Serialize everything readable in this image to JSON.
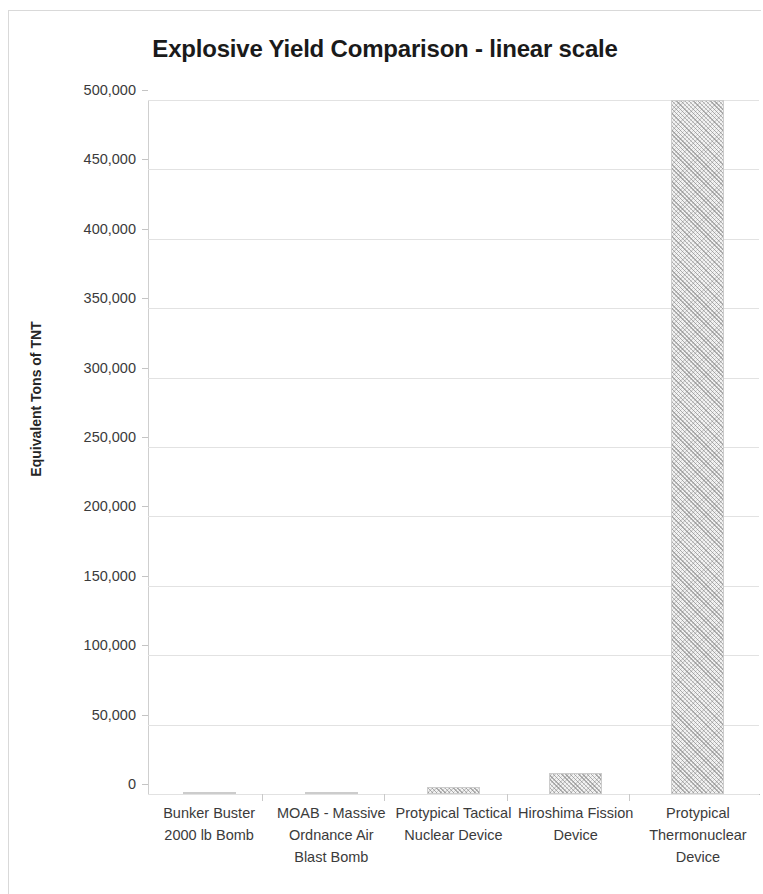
{
  "chart_data": {
    "type": "bar",
    "title": "Explosive Yield Comparison - linear scale",
    "xlabel": "",
    "ylabel": "Equivalent Tons of TNT",
    "ylim": [
      0,
      500000
    ],
    "ytick_step": 50000,
    "grid": true,
    "legend": "none",
    "categories": [
      "Bunker Buster 2000 lb Bomb",
      "MOAB - Massive Ordnance Air Blast Bomb",
      "Protypical Tactical Nuclear Device",
      "Hiroshima Fission Device",
      "Protypical Thermonuclear Device"
    ],
    "values": [
      1,
      11,
      5000,
      15000,
      500000
    ],
    "ytick_labels": [
      "500,000",
      "450,000",
      "400,000",
      "350,000",
      "300,000",
      "250,000",
      "200,000",
      "150,000",
      "100,000",
      "50,000",
      "0"
    ],
    "ytick_values": [
      500000,
      450000,
      400000,
      350000,
      300000,
      250000,
      200000,
      150000,
      100000,
      50000,
      0
    ],
    "bar_color": "#f2f2f2",
    "bar_pattern": "diagonal-crosshatch",
    "grid_color": "#e2e2e2",
    "axis_color": "#cfcfcf",
    "title_color": "#1a1a1a"
  }
}
